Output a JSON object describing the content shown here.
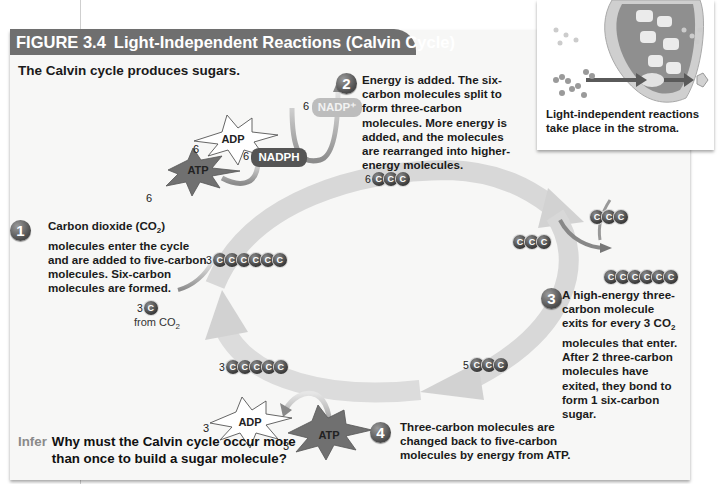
{
  "figure": {
    "number": "FIGURE 3.4",
    "title": "Light-Independent Reactions (Calvin Cycle)",
    "subtitle": "The Calvin cycle produces sugars."
  },
  "inset": {
    "caption": "Light-independent reactions take place in the stroma."
  },
  "steps": [
    {
      "number": "1",
      "text_pre": "Carbon dioxide (CO",
      "text_sub": "2",
      "text_post": ") molecules enter the cycle and are added to five-carbon molecules. Six-carbon molecules are formed."
    },
    {
      "number": "2",
      "text": "Energy is added. The six-carbon molecules split to form three-carbon molecules. More energy is added, and the molecules are rearranged into higher-energy molecules."
    },
    {
      "number": "3",
      "text_pre": "A high-energy three-carbon molecule exits for every 3 CO",
      "text_sub": "2",
      "text_post": " molecules that enter. After 2 three-carbon molecules have exited, they bond to form 1 six-carbon sugar."
    },
    {
      "number": "4",
      "text": "Three-carbon molecules are changed back to five-carbon molecules by energy from ATP."
    }
  ],
  "molecules": {
    "top_atp": {
      "coef": "6",
      "label": "ATP"
    },
    "top_adp": {
      "coef": "6",
      "label": "ADP"
    },
    "nadph": {
      "coef": "6",
      "label": "NADPH"
    },
    "nadp": {
      "coef": "6",
      "label": "NADP⁺"
    },
    "six_ccc": {
      "coef": "6",
      "atoms": "C"
    },
    "three_cccccc": {
      "coef": "3",
      "atoms": "C"
    },
    "co2_in": {
      "coef": "3",
      "atom": "C",
      "label_pre": "from CO",
      "label_sub": "2"
    },
    "exit_ccc": {
      "atoms": "C"
    },
    "exit_ccc_2": {
      "atoms": "C"
    },
    "sugar": {
      "atoms": "C"
    },
    "five_ccc": {
      "coef": "5",
      "atoms": "C"
    },
    "three_ccccc": {
      "coef": "3",
      "atoms": "C"
    },
    "bottom_adp": {
      "coef": "3",
      "label": "ADP"
    },
    "bottom_atp": {
      "coef": "3",
      "label": "ATP"
    }
  },
  "infer": {
    "keyword": "Infer",
    "question": "Why must the Calvin cycle occur more than once to build a sugar molecule?"
  },
  "colors": {
    "header_bg": "#6f6f6f",
    "panel_bg": "#f7f7f6",
    "cycle_arrow": "#d6d6d6",
    "atom": "#444444",
    "nadph": "#555555",
    "nadp": "#bdbdbd",
    "atp_star": "#707070"
  }
}
